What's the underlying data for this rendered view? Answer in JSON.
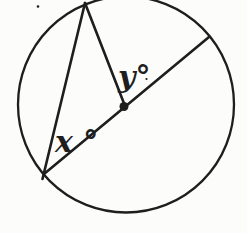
{
  "figure": {
    "canvas": {
      "width": 247,
      "height": 233,
      "background": "#fcfcfa",
      "ink": "#1e1e1e"
    },
    "circle": {
      "cx": 126,
      "cy": 104.5,
      "r": 108,
      "stroke_width": 2.3
    },
    "segments": {
      "diameter": {
        "x1": 44,
        "y1": 174,
        "x2": 209,
        "y2": 37,
        "stroke_width": 2.6
      },
      "chord": {
        "x1": 42.5,
        "y1": 179,
        "x2": 85,
        "y2": 3,
        "stroke_width": 2.6
      },
      "radius": {
        "x1": 85,
        "y1": 3,
        "x2": 125,
        "y2": 106,
        "stroke_width": 2.6
      }
    },
    "center_dot": {
      "cx": 124,
      "cy": 106.5,
      "r": 4.5
    },
    "specks": {
      "top_left": {
        "cx": 38,
        "cy": 6.5,
        "r": 1.3
      },
      "after_y_label": {
        "cx": 146.5,
        "cy": 79,
        "r": 1.1
      }
    },
    "labels": {
      "x_angle": {
        "text": "x °",
        "x": 55,
        "y": 152,
        "font_size": 30
      },
      "y_angle": {
        "text": "y°",
        "x": 118,
        "y": 87,
        "font_size": 30
      }
    }
  }
}
